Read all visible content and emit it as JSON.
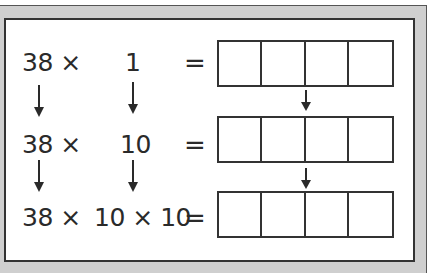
{
  "rows": [
    {
      "left": "38 ×",
      "middle": "1",
      "equals": "="
    },
    {
      "left": "38 ×",
      "middle": "10",
      "equals": "="
    },
    {
      "left": "38 ×",
      "middle": "10 × 10",
      "equals": "="
    }
  ],
  "answer_boxes": {
    "rows": 3,
    "cells_per_row": 4,
    "values": [
      [
        "",
        "",
        "",
        ""
      ],
      [
        "",
        "",
        "",
        ""
      ],
      [
        "",
        "",
        "",
        ""
      ]
    ]
  },
  "colors": {
    "frame_gray": "#cfcfcf",
    "ink": "#2a2a2a",
    "background": "#ffffff"
  }
}
